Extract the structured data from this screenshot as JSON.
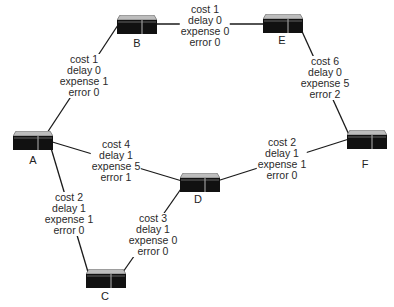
{
  "diagram": {
    "type": "network-topology",
    "nodes": [
      {
        "id": "A",
        "label": "A",
        "x": 13,
        "y": 131,
        "lx": 23,
        "ly": 155
      },
      {
        "id": "B",
        "label": "B",
        "x": 117,
        "y": 15,
        "lx": 127,
        "ly": 38
      },
      {
        "id": "C",
        "label": "C",
        "x": 86,
        "y": 269,
        "lx": 95,
        "ly": 291
      },
      {
        "id": "D",
        "label": "D",
        "x": 180,
        "y": 173,
        "lx": 188,
        "ly": 194
      },
      {
        "id": "E",
        "label": "E",
        "x": 263,
        "y": 14,
        "lx": 272,
        "ly": 35
      },
      {
        "id": "F",
        "label": "F",
        "x": 347,
        "y": 130,
        "lx": 355,
        "ly": 159
      }
    ],
    "edges": [
      {
        "id": "A-B",
        "from": "A",
        "to": "B",
        "cost": "cost 1",
        "delay": "delay 0",
        "expense": "expense 1",
        "error": "error 0",
        "label_x": 84,
        "label_y": 54
      },
      {
        "id": "B-E",
        "from": "B",
        "to": "E",
        "cost": "cost 1",
        "delay": "delay 0",
        "expense": "expense 0",
        "error": "error 0",
        "label_x": 205,
        "label_y": 4
      },
      {
        "id": "E-F",
        "from": "E",
        "to": "F",
        "cost": "cost 6",
        "delay": "delay 0",
        "expense": "expense 5",
        "error": "error 2",
        "label_x": 325,
        "label_y": 56
      },
      {
        "id": "A-D",
        "from": "A",
        "to": "D",
        "cost": "cost 4",
        "delay": "delay 1",
        "expense": "expense 5",
        "error": "error 1",
        "label_x": 116,
        "label_y": 139
      },
      {
        "id": "D-F",
        "from": "D",
        "to": "F",
        "cost": "cost 2",
        "delay": "delay 1",
        "expense": "expense 1",
        "error": "error 0",
        "label_x": 282,
        "label_y": 137
      },
      {
        "id": "A-C",
        "from": "A",
        "to": "C",
        "cost": "cost 2",
        "delay": "delay 1",
        "expense": "expense 1",
        "error": "error 0",
        "label_x": 69,
        "label_y": 192
      },
      {
        "id": "C-D",
        "from": "C",
        "to": "D",
        "cost": "cost 3",
        "delay": "delay 1",
        "expense": "expense 0",
        "error": "error 0",
        "label_x": 153,
        "label_y": 213
      }
    ],
    "lines": [
      {
        "id": "A-B",
        "x1": 47,
        "y1": 133,
        "x2": 120,
        "y2": 22
      },
      {
        "id": "B-E",
        "x1": 155,
        "y1": 24,
        "x2": 264,
        "y2": 24
      },
      {
        "id": "E-F",
        "x1": 300,
        "y1": 27,
        "x2": 350,
        "y2": 137
      },
      {
        "id": "A-D",
        "x1": 49,
        "y1": 141,
        "x2": 182,
        "y2": 181
      },
      {
        "id": "D-F",
        "x1": 217,
        "y1": 181,
        "x2": 349,
        "y2": 139
      },
      {
        "id": "A-C",
        "x1": 51,
        "y1": 148,
        "x2": 88,
        "y2": 272
      },
      {
        "id": "C-D",
        "x1": 123,
        "y1": 272,
        "x2": 183,
        "y2": 186
      }
    ],
    "colors": {
      "router_body": "#111111",
      "router_top": "#bdbdbd",
      "router_divider": "#9a9a9a",
      "line": "#1a1a1a",
      "text": "#2a2a2a"
    }
  }
}
